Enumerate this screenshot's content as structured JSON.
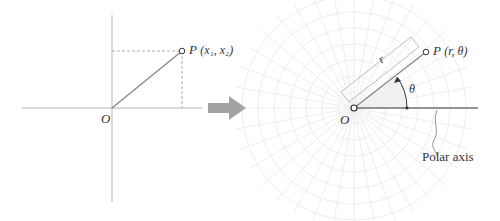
{
  "cartesian": {
    "origin_label": "O",
    "point_label": "P",
    "point_coords": "(x₁, x₂)"
  },
  "transform_arrow": {
    "icon": "right-arrow-icon",
    "color": "#a0a0a0"
  },
  "polar": {
    "origin_label": "O",
    "point_label": "P",
    "point_coords": "(r, θ)",
    "radius_label": "r",
    "angle_label": "θ",
    "axis_label": "Polar axis"
  },
  "colors": {
    "axis": "#b0b0b0",
    "segment": "#8a8a8a",
    "polar_axis": "#333333",
    "grid": "#e6e6e6",
    "text": "#333333"
  }
}
